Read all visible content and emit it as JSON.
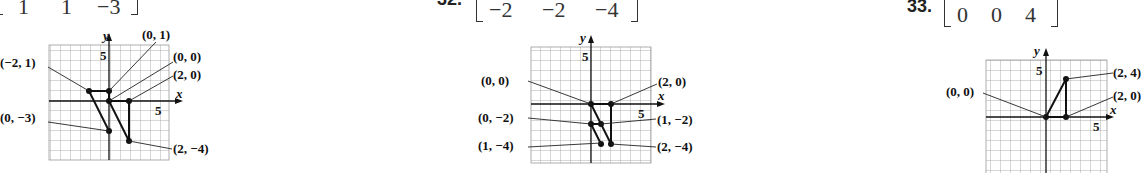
{
  "problems": [
    {
      "number": "",
      "matrix_last_row": [
        "1",
        "1",
        "−3"
      ],
      "graph": {
        "x_axis_label": "x",
        "y_axis_label": "y",
        "x_tick_label": "5",
        "y_tick_label": "5",
        "points": [
          {
            "label": "(−2, 1)",
            "x": -2,
            "y": 1
          },
          {
            "label": "(0, 1)",
            "x": 0,
            "y": 1
          },
          {
            "label": "(0, 0)",
            "x": 0,
            "y": 0
          },
          {
            "label": "(2, 0)",
            "x": 2,
            "y": 0
          },
          {
            "label": "(0, −3)",
            "x": 0,
            "y": -3
          },
          {
            "label": "(2, −4)",
            "x": 2,
            "y": -4
          }
        ]
      }
    },
    {
      "number": "32.",
      "matrix_last_row": [
        "−2",
        "−2",
        "−4"
      ],
      "graph": {
        "x_axis_label": "x",
        "y_axis_label": "y",
        "x_tick_label": "5",
        "y_tick_label": "5",
        "points": [
          {
            "label": "(0, 0)",
            "x": 0,
            "y": 0
          },
          {
            "label": "(2, 0)",
            "x": 2,
            "y": 0
          },
          {
            "label": "(0, −2)",
            "x": 0,
            "y": -2
          },
          {
            "label": "(1, −2)",
            "x": 1,
            "y": -2
          },
          {
            "label": "(1, −4)",
            "x": 1,
            "y": -4
          },
          {
            "label": "(2, −4)",
            "x": 2,
            "y": -4
          }
        ]
      }
    },
    {
      "number": "33.",
      "matrix_last_row": [
        "0",
        "0",
        "4"
      ],
      "graph": {
        "x_axis_label": "x",
        "y_axis_label": "y",
        "x_tick_label": "5",
        "y_tick_label": "5",
        "points": [
          {
            "label": "(0, 0)",
            "x": 0,
            "y": 0
          },
          {
            "label": "(2, 4)",
            "x": 2,
            "y": 4
          },
          {
            "label": "(2, 0)",
            "x": 2,
            "y": 0
          }
        ]
      }
    }
  ]
}
